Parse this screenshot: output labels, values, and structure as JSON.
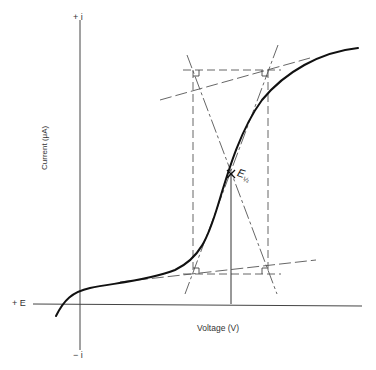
{
  "diagram": {
    "axes": {
      "y_top_label": "+ i",
      "y_bottom_label": "− i",
      "x_left_label": "+ E",
      "y_axis_title": "Current (μA)",
      "x_axis_title": "Voltage (V)"
    },
    "annotations": {
      "half_wave_symbol": "E",
      "half_wave_subscript": "½"
    },
    "colors": {
      "curve": "#111111",
      "axes": "#444444",
      "construction": "#555555",
      "background": "#ffffff"
    }
  }
}
